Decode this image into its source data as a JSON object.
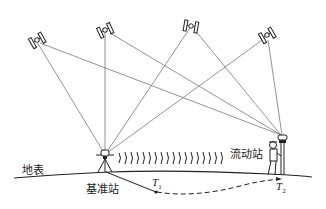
{
  "diagram": {
    "labels": {
      "ground": "地表",
      "base_station": "基准站",
      "rover_station": "流动站",
      "t1": "T",
      "t1_sub": "1",
      "t2": "T",
      "t2_sub": "2"
    },
    "satellites": [
      {
        "name": "satellite-1",
        "x": 35,
        "y": 40
      },
      {
        "name": "satellite-2",
        "x": 105,
        "y": 30
      },
      {
        "name": "satellite-3",
        "x": 190,
        "y": 25
      },
      {
        "name": "satellite-4",
        "x": 267,
        "y": 35
      }
    ],
    "base": {
      "x": 105,
      "y": 156
    },
    "rover": {
      "x": 283,
      "y": 165
    },
    "colors": {
      "line": "#555555",
      "ink": "#222222"
    }
  }
}
